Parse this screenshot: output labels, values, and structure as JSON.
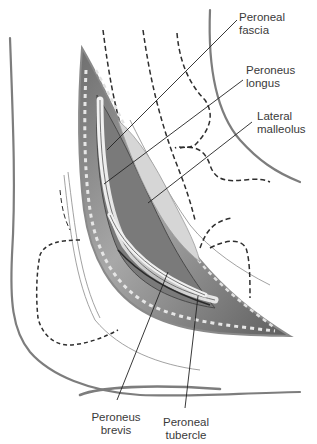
{
  "figure": {
    "labels": [
      {
        "id": "peroneal-fascia",
        "text": "Peroneal\nfascia"
      },
      {
        "id": "peroneus-longus",
        "text": "Peroneus\nlongus"
      },
      {
        "id": "lateral-malleolus",
        "text": "Lateral\nmalleolus"
      },
      {
        "id": "peroneus-brevis",
        "text": "Peroneus\nbrevis"
      },
      {
        "id": "peroneal-tubercle",
        "text": "Peroneal\ntubercle"
      }
    ],
    "colors": {
      "outline": "#7a7a7a",
      "dashed": "#333333",
      "leader": "#222222",
      "tissue_dark": "#5a5a5a",
      "tissue_light": "#d8d8d8"
    }
  }
}
